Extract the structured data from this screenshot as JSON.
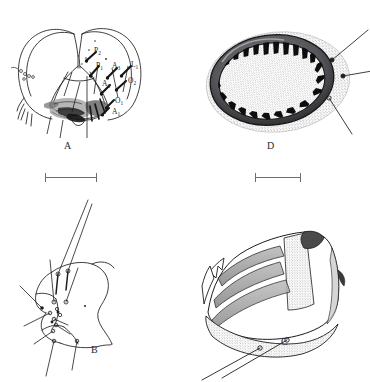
{
  "figure": {
    "type": "scientific-plate",
    "background_color": "#ffffff",
    "ink_color": "#1a1a1a",
    "cropped_header_text": "",
    "panel_count": 4,
    "panel_letters": [
      "A",
      "B",
      "C",
      "D"
    ],
    "scale_bar_count": 2
  },
  "panels": {
    "a": {
      "letter": "A",
      "caption": "",
      "description": "bilobed head capsule in frontal view with shaded ventral mouthparts and labelled setae",
      "chaetotaxy_labels": [
        {
          "id": "p2",
          "base": "P",
          "sub": "2"
        },
        {
          "id": "p1",
          "base": "P",
          "sub": "1"
        },
        {
          "id": "a3",
          "base": "A",
          "sub": "3"
        },
        {
          "id": "l1",
          "base": "L",
          "sub": "1"
        },
        {
          "id": "a2",
          "base": "A",
          "sub": "2"
        },
        {
          "id": "o2",
          "base": "O",
          "sub": "2"
        },
        {
          "id": "o1",
          "base": "O",
          "sub": "1"
        },
        {
          "id": "a1",
          "base": "A",
          "sub": "1"
        }
      ]
    },
    "b": {
      "letter": "B",
      "caption": "",
      "description": "lateral sclerite outline bearing setal sockets and long bristles"
    },
    "c": {
      "letter": "C",
      "caption": "",
      "description": "three-dimensional shaded segment with stippled ridges and two long setae"
    },
    "d": {
      "letter": "D",
      "caption": "",
      "description": "ovoid stippled structure with dark rim bearing inward comb-like teeth and three leader lines"
    }
  },
  "scale_bars": [
    {
      "id": "scale-bar-upper-left",
      "label": "",
      "panel": "A"
    },
    {
      "id": "scale-bar-upper-right",
      "label": "",
      "panel": "D"
    }
  ]
}
